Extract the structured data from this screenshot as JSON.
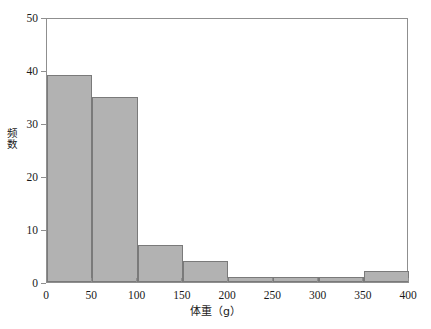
{
  "chart_data": {
    "type": "bar",
    "title": "",
    "subtitle": "",
    "xlabel": "体重（g）",
    "ylabel": "频数",
    "xlim": [
      0,
      400
    ],
    "ylim": [
      0,
      50
    ],
    "grid": false,
    "legend": null,
    "bin_width": 50,
    "bin_edges": [
      0,
      50,
      100,
      150,
      200,
      250,
      300,
      350,
      400
    ],
    "categories": [
      "0-50",
      "50-100",
      "100-150",
      "150-200",
      "200-250",
      "250-300",
      "300-350",
      "350-400"
    ],
    "values": [
      39,
      35,
      7,
      4,
      1,
      1,
      1,
      2
    ],
    "x_ticks": [
      0,
      50,
      100,
      150,
      200,
      250,
      300,
      350,
      400
    ],
    "x_tick_labels": [
      "0",
      "50",
      "100",
      "150",
      "200",
      "250",
      "300",
      "350",
      "400"
    ],
    "y_ticks": [
      0,
      10,
      20,
      30,
      40,
      50
    ],
    "y_tick_labels": [
      "0",
      "10",
      "20",
      "30",
      "40",
      "50"
    ],
    "bar_fill_color": "#b2b2b2",
    "bar_edge_color": "#7a7a7a",
    "axis_color": "#8f8f8f",
    "background_color": "#ffffff"
  }
}
